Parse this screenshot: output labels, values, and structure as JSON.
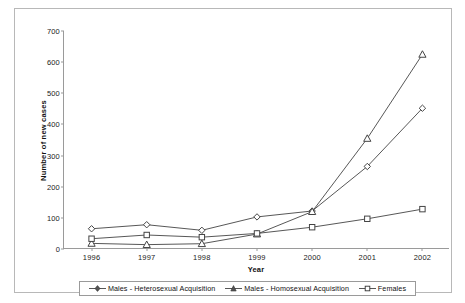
{
  "chart_data": {
    "type": "line",
    "title": "",
    "xlabel": "Year",
    "ylabel": "Number of new cases",
    "categories": [
      "1996",
      "1997",
      "1998",
      "1999",
      "2000",
      "2001",
      "2002"
    ],
    "x": [
      1996,
      1997,
      1998,
      1999,
      2000,
      2001,
      2002
    ],
    "ylim": [
      0,
      700
    ],
    "yticks": [
      0,
      100,
      200,
      300,
      400,
      500,
      600,
      700
    ],
    "grid": false,
    "legend_position": "bottom",
    "series": [
      {
        "name": "Males - Heterosexual Acquisition",
        "marker": "diamond",
        "color": "#444444",
        "values": [
          65,
          78,
          60,
          103,
          122,
          265,
          452
        ]
      },
      {
        "name": "Males - Homosexual Acquisition",
        "marker": "triangle",
        "color": "#444444",
        "values": [
          18,
          14,
          17,
          48,
          120,
          355,
          625
        ]
      },
      {
        "name": "Females",
        "marker": "square",
        "color": "#444444",
        "values": [
          33,
          45,
          38,
          50,
          70,
          97,
          128
        ]
      }
    ]
  },
  "axes": {
    "y_tick_labels": [
      "0",
      "100",
      "200",
      "300",
      "400",
      "500",
      "600",
      "700"
    ],
    "x_tick_labels": [
      "1996",
      "1997",
      "1998",
      "1999",
      "2000",
      "2001",
      "2002"
    ],
    "y_title": "Number of new cases",
    "x_title": "Year"
  },
  "legend": {
    "items": [
      {
        "label": "Males - Heterosexual Acquisition",
        "marker": "diamond-marker"
      },
      {
        "label": "Males - Homosexual Acquisition",
        "marker": "triangle-marker"
      },
      {
        "label": "Females",
        "marker": "square-marker"
      }
    ]
  }
}
